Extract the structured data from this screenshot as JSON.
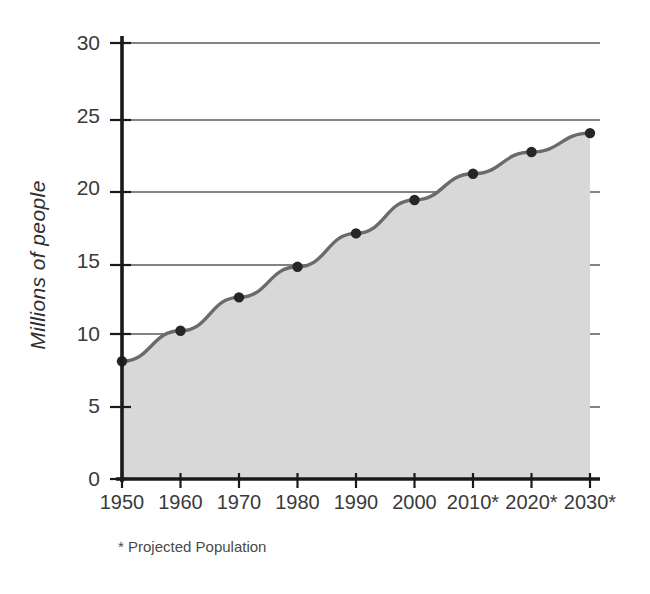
{
  "chart_data": {
    "type": "area",
    "title": "",
    "subtitle": "",
    "xlabel": "",
    "ylabel": "Millions of people",
    "categories": [
      "1950",
      "1960",
      "1970",
      "1980",
      "1990",
      "2000",
      "2010*",
      "2020*",
      "2030*"
    ],
    "x": [
      1950,
      1960,
      1970,
      1980,
      1990,
      2000,
      2010,
      2020,
      2030
    ],
    "values": [
      8.1,
      10.2,
      12.5,
      14.6,
      16.9,
      19.2,
      21.0,
      22.5,
      23.8
    ],
    "series": [
      {
        "name": "Population",
        "values": [
          8.1,
          10.2,
          12.5,
          14.6,
          16.9,
          19.2,
          21.0,
          22.5,
          23.8
        ]
      }
    ],
    "ylim": [
      0,
      30
    ],
    "yticks": [
      0,
      5,
      10,
      15,
      20,
      25,
      30
    ],
    "ytick_labels": [
      "0",
      "5",
      "10",
      "15",
      "20",
      "25",
      "30"
    ],
    "grid": true,
    "grid_axis": "y",
    "legend": "none",
    "annotations": [
      "* Projected Population"
    ],
    "markers": true,
    "fill_color": "#d8d8d8",
    "line_color": "#6b6b6b",
    "marker_color": "#262626",
    "grid_color": "#5a5a5a",
    "axis_color": "#1a1a1a"
  },
  "axis": {
    "y_title": "Millions of people",
    "y_ticks": [
      "30",
      "25",
      "20",
      "15",
      "10",
      "5",
      "0"
    ],
    "x_ticks": [
      "1950",
      "1960",
      "1970",
      "1980",
      "1990",
      "2000",
      "2010*",
      "2020*",
      "2030*"
    ]
  },
  "footnote": {
    "text": "* Projected Population"
  }
}
